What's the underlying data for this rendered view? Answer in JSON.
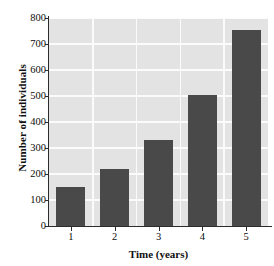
{
  "chart_data": {
    "type": "bar",
    "title": "",
    "subtitle": "",
    "xlabel": "Time (years)",
    "ylabel": "Number of individuals",
    "categories": [
      "1",
      "2",
      "3",
      "4",
      "5"
    ],
    "values": [
      150,
      220,
      330,
      505,
      755
    ],
    "series": [
      {
        "name": "Number of individuals",
        "values": [
          150,
          220,
          330,
          505,
          755
        ]
      }
    ],
    "ylim": [
      0,
      800
    ],
    "ytick_labels": [
      "0",
      "100",
      "200",
      "300",
      "400",
      "500",
      "600",
      "700",
      "800"
    ],
    "ytick_values": [
      0,
      100,
      200,
      300,
      400,
      500,
      600,
      700,
      800
    ],
    "xtick_labels": [
      "1",
      "2",
      "3",
      "4",
      "5"
    ],
    "grid": true,
    "grid_orientation": "both",
    "legend": false,
    "legend_position": "none",
    "colors": {
      "bar_fill": "#494949",
      "plot_background": "#e3e3e3",
      "grid_line": "#fbfbfb",
      "axis_line": "#2b2b2b",
      "text": "#0c0c0c",
      "figure_background": "#ffffff"
    }
  }
}
